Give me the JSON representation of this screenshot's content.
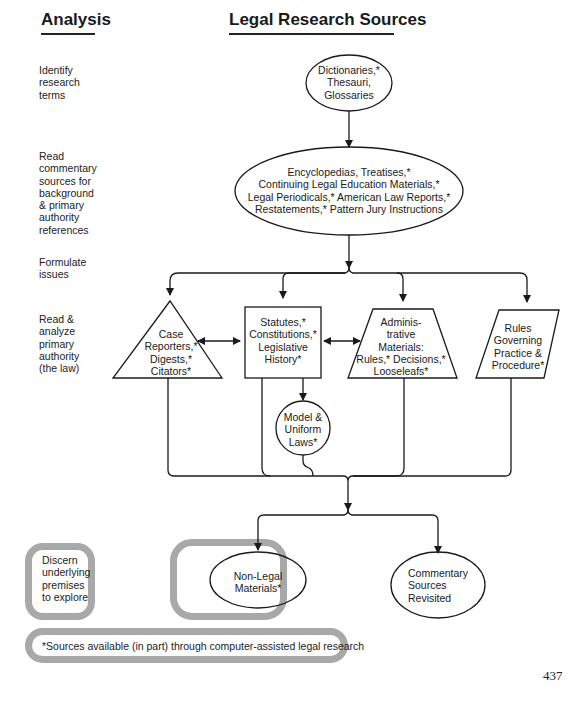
{
  "headers": {
    "analysis": "Analysis",
    "sources": "Legal Research Sources"
  },
  "analysis_steps": [
    {
      "id": "identify",
      "text": "Identify\nresearch\nterms"
    },
    {
      "id": "read-commentary",
      "text": "Read\ncommentary\nsources for\nbackground\n& primary\nauthority\nreferences"
    },
    {
      "id": "formulate",
      "text": "Formulate\nissues"
    },
    {
      "id": "read-analyze",
      "text": "Read &\nanalyze\nprimary\nauthority\n(the law)"
    },
    {
      "id": "discern",
      "text": "Discern\nunderlying\npremises\nto explore"
    }
  ],
  "nodes": {
    "dictionaries": {
      "shape": "ellipse",
      "text": "Dictionaries,*\nThesauri,\nGlossaries"
    },
    "encyclopedias": {
      "shape": "ellipse",
      "text": "Encyclopedias, Treatises,*\nContinuing Legal Education Materials,*\nLegal Periodicals,* American Law Reports,*\nRestatements,* Pattern Jury Instructions"
    },
    "case_reporters": {
      "shape": "triangle",
      "text": "Case\nReporters,*\nDigests,*\nCitators*"
    },
    "statutes": {
      "shape": "rectangle",
      "text": "Statutes,*\nConstitutions,*\nLegislative\nHistory*"
    },
    "administrative": {
      "shape": "trapezoid",
      "text": "Adminis-\ntrative\nMaterials:\nRules,* Decisions,*\nLooseleafs*"
    },
    "rules": {
      "shape": "parallelogram",
      "text": "Rules\nGoverning\nPractice &\nProcedure*"
    },
    "model_laws": {
      "shape": "circle",
      "text": "Model &\nUniform\nLaws*"
    },
    "non_legal": {
      "shape": "ellipse",
      "text": "Non-Legal\nMaterials*"
    },
    "commentary_revisited": {
      "shape": "ellipse",
      "text": "Commentary\nSources\nRevisited"
    }
  },
  "footnote": "*Sources available (in part) through computer-assisted legal research",
  "page_number": "437",
  "colors": {
    "line": "#1a1a1a",
    "frame_gray": "#a8a8a8"
  }
}
